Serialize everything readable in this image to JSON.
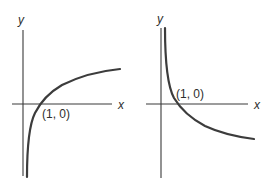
{
  "figures": [
    {
      "id": "left",
      "description": "Increasing logarithmic-type curve through (1, 0)",
      "x_axis_label": "x",
      "y_axis_label": "y",
      "point_label": "(1, 0)"
    },
    {
      "id": "right",
      "description": "Decreasing logarithmic-type curve through (1, 0)",
      "x_axis_label": "x",
      "y_axis_label": "y",
      "point_label": "(1, 0)"
    }
  ],
  "colors": {
    "axis": "#3a3a3a",
    "curve": "#3c3c3c",
    "background": "#ffffff"
  }
}
